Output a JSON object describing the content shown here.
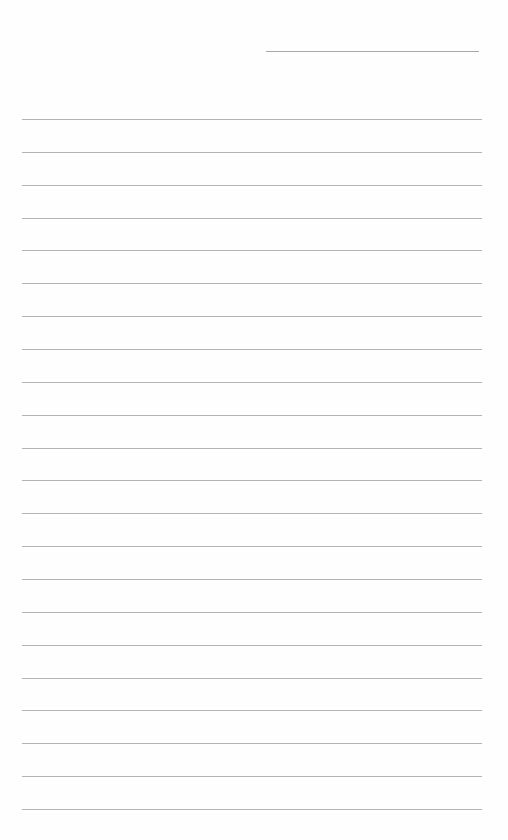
{
  "page": {
    "type": "blank lined paper",
    "header_line": {
      "label": ""
    },
    "ruled_lines": {
      "count": 22,
      "first_y": 119,
      "spacing": 32.86
    },
    "colors": {
      "background": "#fefefe",
      "rule": "#b4b4b4"
    }
  }
}
